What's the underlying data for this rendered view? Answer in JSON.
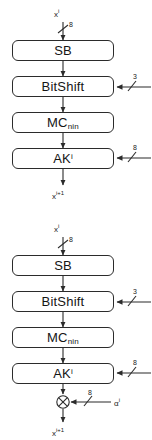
{
  "figure": {
    "stroke_color": "#2b2b2b",
    "background": "#ffffff"
  },
  "diagrams": [
    {
      "id": "round-without-alpha",
      "input_label": "x",
      "input_superscript": "i",
      "input_width": "8",
      "blocks": [
        {
          "name": "sb",
          "label": "SB",
          "sub": "",
          "sup": ""
        },
        {
          "name": "bitshift",
          "label": "BitShift",
          "sub": "",
          "sup": ""
        },
        {
          "name": "mc",
          "label": "MC",
          "sub": "nin",
          "sup": ""
        },
        {
          "name": "ak",
          "label": "AK",
          "sub": "",
          "sup": "i"
        }
      ],
      "side_inputs": [
        {
          "target": "bitshift",
          "width": "3"
        },
        {
          "target": "ak",
          "width": "8"
        }
      ],
      "has_xor": false,
      "output_label": "x",
      "output_superscript": "i+1"
    },
    {
      "id": "round-with-alpha",
      "input_label": "x",
      "input_superscript": "i",
      "input_width": "8",
      "blocks": [
        {
          "name": "sb",
          "label": "SB",
          "sub": "",
          "sup": ""
        },
        {
          "name": "bitshift",
          "label": "BitShift",
          "sub": "",
          "sup": ""
        },
        {
          "name": "mc",
          "label": "MC",
          "sub": "nin",
          "sup": ""
        },
        {
          "name": "ak",
          "label": "AK",
          "sub": "",
          "sup": "i"
        }
      ],
      "side_inputs": [
        {
          "target": "bitshift",
          "width": "3"
        },
        {
          "target": "ak",
          "width": "8"
        }
      ],
      "has_xor": true,
      "xor": {
        "operator": "⊗",
        "input_width": "8",
        "input_label": "α",
        "input_superscript": "i"
      },
      "output_label": "x",
      "output_superscript": "i+1"
    }
  ]
}
